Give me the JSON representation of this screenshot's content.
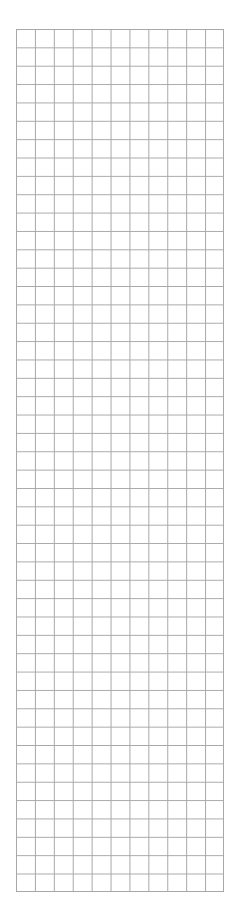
{
  "grid": {
    "columns": 11,
    "rows": 47,
    "line_color": "#a8a8a8",
    "background": "#ffffff"
  }
}
